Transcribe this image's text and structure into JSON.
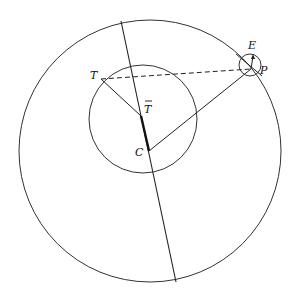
{
  "diagram": {
    "labels": {
      "E": "E",
      "P": "P",
      "T": "T",
      "T_bar": "T",
      "C": "C"
    },
    "colors": {
      "stroke": "#222222",
      "background": "#ffffff"
    }
  }
}
